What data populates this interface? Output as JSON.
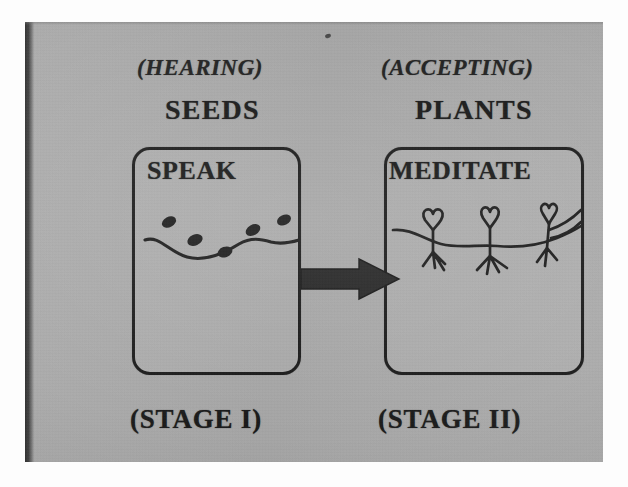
{
  "figure": {
    "kind": "two-stage-process-diagram",
    "medium": "photograph of a printed page",
    "background_color": "#a9a9a9",
    "ink_color": "#171717"
  },
  "stages": [
    {
      "id": "stage-1",
      "parenthetical": "(HEARING)",
      "heading": "SEEDS",
      "box_title": "SPEAK",
      "stage_label": "(STAGE I)",
      "sketch": "seeds-scattered-on-ground-line"
    },
    {
      "id": "stage-2",
      "parenthetical": "(ACCEPTING)",
      "heading": "PLANTS",
      "box_title": "MEDITATE",
      "stage_label": "(STAGE II)",
      "sketch": "three-sprouted-plants-with-roots"
    }
  ],
  "connector": {
    "name": "right-arrow",
    "direction": "left-to-right",
    "glyph": "➡"
  }
}
